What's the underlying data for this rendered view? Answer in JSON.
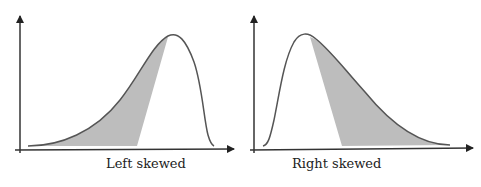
{
  "panels": [
    {
      "id": "left",
      "label": "Left skewed",
      "skew": "left"
    },
    {
      "id": "right",
      "label": "Right skewed",
      "skew": "right"
    }
  ],
  "colors": {
    "curve": "#555555",
    "axis": "#333333",
    "shade": "#bdbdbd",
    "background": "#ffffff"
  }
}
